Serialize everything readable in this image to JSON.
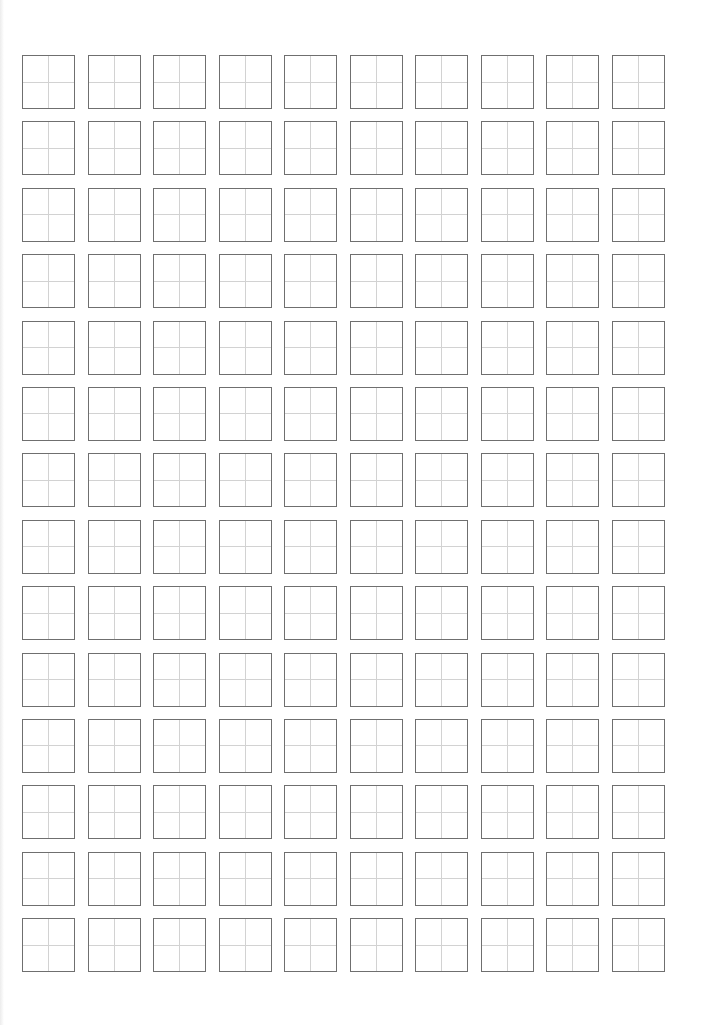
{
  "page": {
    "type": "tianzige-practice-sheet",
    "background_color": "#ffffff"
  },
  "grid": {
    "columns": 10,
    "rows": 14,
    "cell_border_color": "#6f6f6f",
    "guide_line_color": "#d2d2d2",
    "guide_lines": [
      "vertical-center",
      "horizontal-center"
    ],
    "cells_filled": 0
  }
}
